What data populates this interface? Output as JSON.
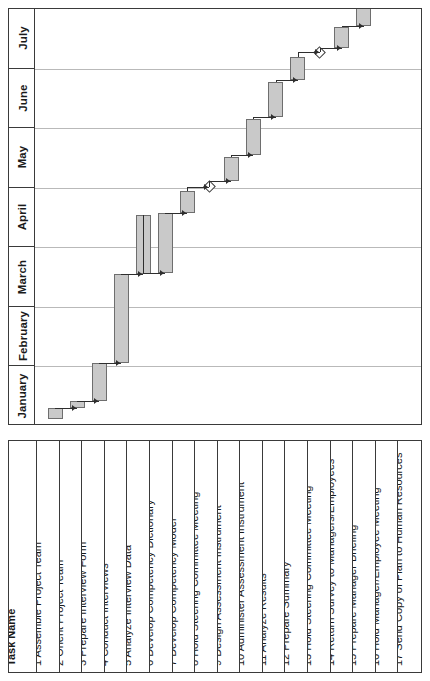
{
  "chart_data": {
    "type": "bar",
    "subtype": "gantt",
    "title": "",
    "orientation": "rotated-90",
    "xlabel": "",
    "ylabel": "",
    "time_axis": {
      "label": "",
      "categories": [
        "January",
        "February",
        "March",
        "April",
        "May",
        "June",
        "July"
      ],
      "order_on_screen_top_to_bottom": [
        "July",
        "June",
        "May",
        "April",
        "March",
        "February",
        "January"
      ],
      "range": [
        "January",
        "July"
      ],
      "grid": true
    },
    "columns": [
      "Task Name"
    ],
    "tasks": [
      {
        "id": 1,
        "name": "Assemble Project Team",
        "type": "bar",
        "start_month": "January",
        "end_month": "January",
        "start_frac": 0.12,
        "end_frac": 0.3
      },
      {
        "id": 2,
        "name": "Orient Project Team",
        "type": "bar",
        "start_month": "January",
        "end_month": "January",
        "start_frac": 0.3,
        "end_frac": 0.42
      },
      {
        "id": 3,
        "name": "Prepare Interview Form",
        "type": "bar",
        "start_month": "January",
        "end_month": "February",
        "start_frac": 0.42,
        "end_frac": 1.05
      },
      {
        "id": 4,
        "name": "Conduct Interviews",
        "type": "bar",
        "start_month": "February",
        "end_month": "March",
        "start_frac": 1.05,
        "end_frac": 2.55
      },
      {
        "id": 5,
        "name": "Analyze Interview Data",
        "type": "bar",
        "start_month": "March",
        "end_month": "April",
        "start_frac": 2.55,
        "end_frac": 3.55
      },
      {
        "id": 6,
        "name": "Develop Competency Dictionary",
        "type": "bar",
        "start_month": "March",
        "end_month": "April",
        "start_frac": 2.57,
        "end_frac": 3.57
      },
      {
        "id": 7,
        "name": "Develop Competency Model",
        "type": "bar",
        "start_month": "April",
        "end_month": "April",
        "start_frac": 3.58,
        "end_frac": 3.95
      },
      {
        "id": 8,
        "name": "Hold Steering Committee Meeting",
        "type": "milestone",
        "start_month": "April",
        "end_month": "April",
        "start_frac": 4.02,
        "end_frac": 4.02
      },
      {
        "id": 9,
        "name": "Design Assessment Instrument",
        "type": "bar",
        "start_month": "April",
        "end_month": "May",
        "start_frac": 4.12,
        "end_frac": 4.52
      },
      {
        "id": 10,
        "name": "Administer Assessment Instrument",
        "type": "bar",
        "start_month": "May",
        "end_month": "May",
        "start_frac": 4.55,
        "end_frac": 5.15
      },
      {
        "id": 11,
        "name": "Analyze Results",
        "type": "bar",
        "start_month": "May",
        "end_month": "June",
        "start_frac": 5.18,
        "end_frac": 5.78
      },
      {
        "id": 12,
        "name": "Prepare Summary",
        "type": "bar",
        "start_month": "June",
        "end_month": "June",
        "start_frac": 5.8,
        "end_frac": 6.2
      },
      {
        "id": 13,
        "name": "Hold Steering Committee Meeting",
        "type": "milestone",
        "start_month": "June",
        "end_month": "June",
        "start_frac": 6.27,
        "end_frac": 6.27
      },
      {
        "id": 14,
        "name": "Return Survey to Managers/Employees",
        "type": "bar",
        "start_month": "June",
        "end_month": "June",
        "start_frac": 6.35,
        "end_frac": 6.7
      },
      {
        "id": 15,
        "name": "Prepare Manager Briefing",
        "type": "bar",
        "start_month": "June",
        "end_month": "July",
        "start_frac": 6.72,
        "end_frac": 7.3
      },
      {
        "id": 16,
        "name": "Hold Manager/Employee Meeting",
        "type": "bar",
        "start_month": "July",
        "end_month": "July",
        "start_frac": 7.32,
        "end_frac": 7.45
      },
      {
        "id": 17,
        "name": "Send Copy of Plan to Human Resources",
        "type": "bar",
        "start_month": "July",
        "end_month": "July",
        "start_frac": 7.5,
        "end_frac": 7.85
      }
    ],
    "legend": [],
    "annotations": [
      {
        "text": "milestone-diamond",
        "task_id": 8
      },
      {
        "text": "milestone-diamond",
        "task_id": 13
      }
    ],
    "colors": {
      "bar_fill": "#c9c9c9",
      "bar_border": "#6e6e6e",
      "grid": "#b9b9b9",
      "frame": "#3a3a3a",
      "link": "#2e2e2e",
      "background": "#ffffff"
    }
  },
  "table": {
    "header": "Task Name"
  }
}
